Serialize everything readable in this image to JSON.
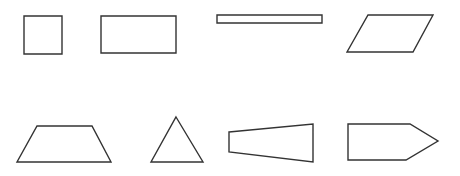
{
  "diagram": {
    "title": "",
    "background": "#ffffff",
    "stroke_color": "#333333",
    "shapes": [
      {
        "name": "square",
        "type": "polygon",
        "points": "24,16 62,16 62,54 24,54"
      },
      {
        "name": "rectangle",
        "type": "polygon",
        "points": "101,16 176,16 176,53 101,53"
      },
      {
        "name": "thin-rectangle",
        "type": "polygon",
        "points": "217,15 322,15 322,23 217,23"
      },
      {
        "name": "parallelogram",
        "type": "polygon",
        "points": "368,15 433,15 413,52 347,52"
      },
      {
        "name": "trapezoid",
        "type": "polygon",
        "points": "37,126 92,126 111,162 17,162"
      },
      {
        "name": "triangle",
        "type": "polygon",
        "points": "176,117 203,162 151,162"
      },
      {
        "name": "tapered-quadrilateral",
        "type": "polygon",
        "points": "229,132 313,124 313,162 229,152"
      },
      {
        "name": "pentagon-arrow",
        "type": "polygon",
        "points": "348,124 410,124 438,141 406,160 348,160"
      }
    ]
  }
}
